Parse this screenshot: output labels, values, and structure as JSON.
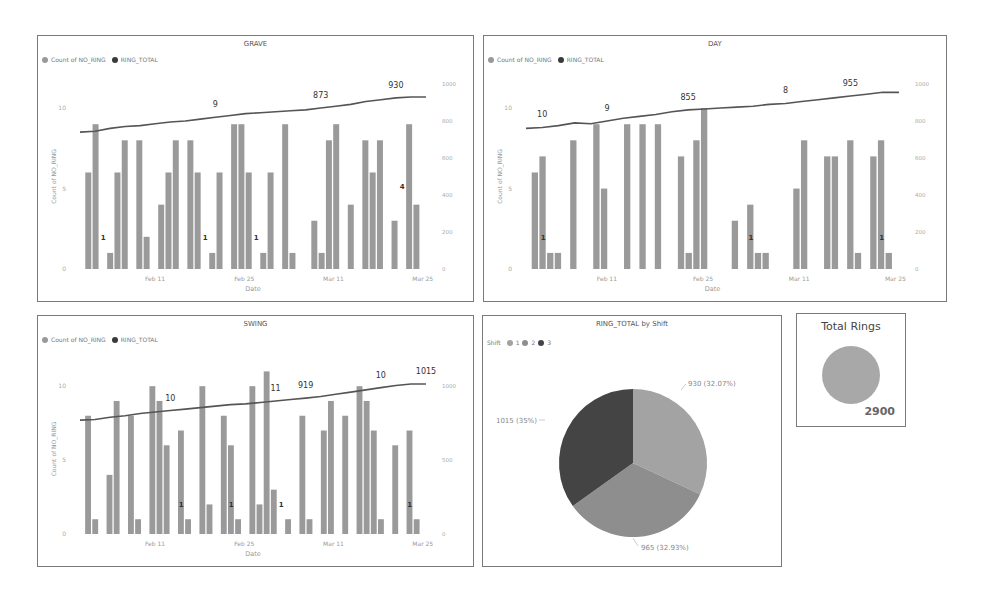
{
  "colors": {
    "bar": "#9a9a9a",
    "line": "#555555",
    "legend_bar": "#9a9a9a",
    "legend_line": "#3a3a3a",
    "pie_shift1": "#a3a3a3",
    "pie_shift2": "#8e8e8e",
    "pie_shift3": "#444444",
    "card_circle": "#a8a8a8"
  },
  "legend": {
    "bar_label": "Count of NO_RING",
    "line_label": "RING_TOTAL"
  },
  "panels": {
    "grave": {
      "title": "GRAVE",
      "ylabel": "Count of NO_RING",
      "xlabel": "Date"
    },
    "day": {
      "title": "DAY",
      "ylabel": "Count of NO_RING",
      "xlabel": "Date"
    },
    "swing": {
      "title": "SWING",
      "ylabel": "Count of NO_RING",
      "xlabel": "Date"
    },
    "pie": {
      "title": "RING_TOTAL by Shift",
      "legend_title": "Shift",
      "legend_items": [
        "1",
        "2",
        "3"
      ]
    },
    "card": {
      "title": "Total Rings",
      "value": "2900"
    }
  },
  "chart_data": [
    {
      "type": "bar+line",
      "title": "GRAVE",
      "xlabel": "Date",
      "ylabel": "Count of NO_RING",
      "x_ticks": [
        "Feb 11",
        "Feb 25",
        "Mar 11",
        "Mar 25"
      ],
      "y_left_ticks": [
        0,
        5,
        10
      ],
      "y_left_range": [
        0,
        11.5
      ],
      "y_right_ticks": [
        0,
        200,
        400,
        600,
        800,
        1000
      ],
      "y_right_range": [
        0,
        1000
      ],
      "legend": [
        "Count of NO_RING",
        "RING_TOTAL"
      ],
      "bars": [
        6,
        9,
        0,
        1,
        6,
        8,
        0,
        8,
        2,
        0,
        4,
        6,
        8,
        0,
        8,
        6,
        0,
        1,
        6,
        0,
        9,
        9,
        6,
        0,
        1,
        6,
        0,
        9,
        1,
        0,
        0,
        3,
        1,
        8,
        9,
        0,
        4,
        0,
        8,
        6,
        8,
        0,
        3,
        0,
        9,
        4
      ],
      "bar_labels": [
        {
          "index": 3,
          "label": "1"
        },
        {
          "index": 17,
          "label": "1"
        },
        {
          "index": 24,
          "label": "1"
        },
        {
          "index": 44,
          "label": "4"
        }
      ],
      "line": [
        740,
        745,
        760,
        770,
        775,
        785,
        795,
        800,
        810,
        820,
        830,
        840,
        845,
        850,
        855,
        860,
        870,
        880,
        890,
        905,
        915,
        925,
        930,
        930
      ],
      "line_labels": [
        {
          "index": 9,
          "label": "9"
        },
        {
          "index": 16,
          "label": "873"
        },
        {
          "index": 21,
          "label": "930"
        }
      ]
    },
    {
      "type": "bar+line",
      "title": "DAY",
      "xlabel": "Date",
      "ylabel": "Count of NO_RING",
      "x_ticks": [
        "Feb 11",
        "Feb 25",
        "Mar 11",
        "Mar 25"
      ],
      "y_left_ticks": [
        0,
        5,
        10
      ],
      "y_left_range": [
        0,
        11.5
      ],
      "y_right_ticks": [
        0,
        200,
        400,
        600,
        800,
        1000
      ],
      "y_right_range": [
        0,
        1000
      ],
      "legend": [
        "Count of NO_RING",
        "RING_TOTAL"
      ],
      "bars": [
        6,
        7,
        1,
        1,
        0,
        8,
        0,
        0,
        9,
        5,
        0,
        0,
        9,
        0,
        9,
        0,
        9,
        0,
        0,
        7,
        1,
        8,
        10,
        0,
        0,
        0,
        3,
        0,
        4,
        1,
        1,
        0,
        0,
        0,
        5,
        8,
        0,
        0,
        7,
        7,
        0,
        8,
        1,
        0,
        7,
        8,
        1
      ],
      "bar_labels": [
        {
          "index": 2,
          "label": "1"
        },
        {
          "index": 29,
          "label": "1"
        },
        {
          "index": 46,
          "label": "1"
        }
      ],
      "line": [
        760,
        765,
        775,
        790,
        785,
        800,
        815,
        825,
        835,
        850,
        860,
        865,
        870,
        875,
        880,
        890,
        895,
        905,
        915,
        925,
        935,
        945,
        955,
        955
      ],
      "line_labels": [
        {
          "index": 1,
          "label": "10"
        },
        {
          "index": 5,
          "label": "9"
        },
        {
          "index": 10,
          "label": "855"
        },
        {
          "index": 16,
          "label": "8"
        },
        {
          "index": 20,
          "label": "955"
        }
      ]
    },
    {
      "type": "bar+line",
      "title": "SWING",
      "xlabel": "Date",
      "ylabel": "Count of NO_RING",
      "x_ticks": [
        "Feb 11",
        "Feb 25",
        "Mar 11",
        "Mar 25"
      ],
      "y_left_ticks": [
        0,
        5,
        10
      ],
      "y_left_range": [
        0,
        11.5
      ],
      "y_right_ticks": [
        0,
        500,
        1000
      ],
      "y_right_range": [
        0,
        1150
      ],
      "legend": [
        "Count of NO_RING",
        "RING_TOTAL"
      ],
      "bars": [
        8,
        1,
        0,
        4,
        9,
        0,
        8,
        1,
        0,
        10,
        9,
        6,
        0,
        7,
        1,
        0,
        10,
        2,
        0,
        8,
        6,
        1,
        0,
        10,
        2,
        11,
        3,
        0,
        1,
        0,
        8,
        1,
        0,
        7,
        9,
        0,
        8,
        0,
        10,
        9,
        7,
        1,
        0,
        6,
        0,
        7,
        1
      ],
      "bar_labels": [
        {
          "index": 14,
          "label": "1"
        },
        {
          "index": 21,
          "label": "1"
        },
        {
          "index": 28,
          "label": "1"
        },
        {
          "index": 46,
          "label": "1"
        }
      ],
      "line": [
        770,
        775,
        790,
        800,
        815,
        825,
        835,
        845,
        855,
        865,
        875,
        880,
        890,
        900,
        910,
        919,
        930,
        945,
        960,
        975,
        990,
        1005,
        1015,
        1015
      ],
      "line_labels": [
        {
          "index": 6,
          "label": "10"
        },
        {
          "index": 13,
          "label": "11"
        },
        {
          "index": 15,
          "label": "919"
        },
        {
          "index": 20,
          "label": "10"
        },
        {
          "index": 23,
          "label": "1015"
        }
      ]
    },
    {
      "type": "pie",
      "title": "RING_TOTAL by Shift",
      "legend_title": "Shift",
      "categories": [
        "1",
        "2",
        "3"
      ],
      "values": [
        930,
        965,
        1015
      ],
      "labels": [
        "930 (32.07%)",
        "965 (32.93%)",
        "1015 (35%)"
      ],
      "legend_position": "top-left"
    },
    {
      "type": "card",
      "title": "Total Rings",
      "value": 2900
    }
  ]
}
